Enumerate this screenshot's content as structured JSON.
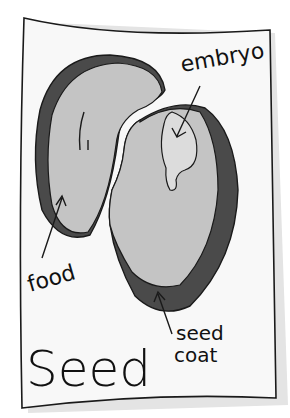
{
  "diagram": {
    "title": "Seed",
    "labels": {
      "embryo": "embryo",
      "food": "food",
      "seed_coat_line1": "seed",
      "seed_coat_line2": "coat"
    }
  },
  "colors": {
    "paper": "#f8f8f8",
    "outline": "#1a1a1a",
    "seed_coat": "#4a4a4a",
    "food": "#c4c4c4",
    "embryo": "#d8d8d8",
    "shadow": "#d9d9d9"
  }
}
